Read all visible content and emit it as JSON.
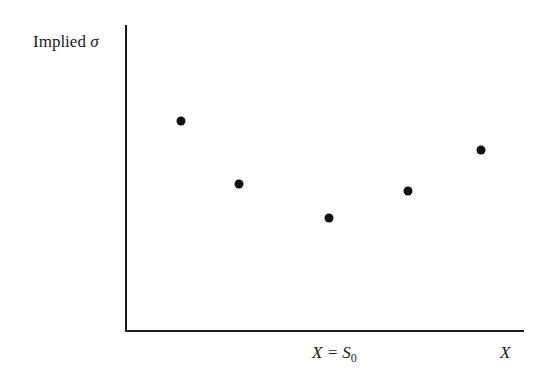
{
  "chart_data": {
    "type": "scatter",
    "title": "",
    "ylabel": "Implied σ",
    "xlabel": "X",
    "annotations": [
      {
        "text": "X = S0",
        "position": "x-axis",
        "meaning": "strike equals spot (at-the-money)"
      }
    ],
    "x": [
      1,
      2,
      3,
      4,
      5
    ],
    "y": [
      4.6,
      3.2,
      2.5,
      3.1,
      4.0
    ],
    "pixel_points": [
      [
        181,
        121
      ],
      [
        239,
        184
      ],
      [
        329,
        218
      ],
      [
        408,
        191
      ],
      [
        481,
        150
      ]
    ],
    "grid": false,
    "legend": null
  },
  "labels": {
    "y_axis_text": "Implied ",
    "y_axis_symbol": "σ",
    "atm_label_x": "X = S",
    "atm_label_sub": "0",
    "x_axis_label": "X"
  },
  "colors": {
    "axis": "#1a1a1a",
    "points": "#111111",
    "background": "#ffffff"
  }
}
